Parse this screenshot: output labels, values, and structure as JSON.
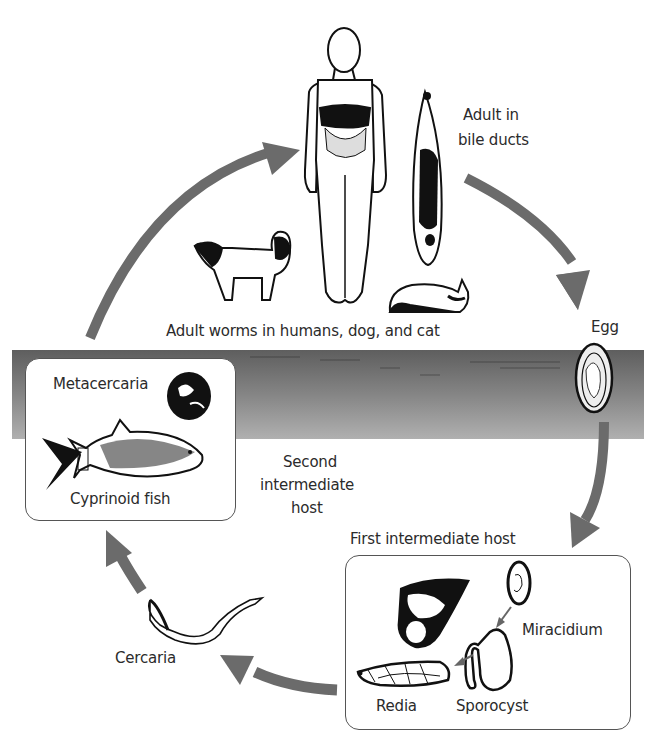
{
  "diagram": {
    "type": "life-cycle",
    "colors": {
      "arrow": "#6b6b6b",
      "water_top": "#5e5e5e",
      "water_bottom": "#ababab",
      "box_border": "#555555",
      "ink": "#111111",
      "text": "#2b2b2b"
    },
    "labels": {
      "adult_in_bile_ducts_line1": "Adult in",
      "adult_in_bile_ducts_line2": "bile ducts",
      "definitive_hosts": "Adult worms in humans, dog, and cat",
      "egg": "Egg",
      "metacercaria": "Metacercaria",
      "cyprinoid_fish": "Cyprinoid fish",
      "second_host_line1": "Second",
      "second_host_line2": "intermediate",
      "second_host_line3": "host",
      "first_intermediate_host": "First intermediate host",
      "miracidium": "Miracidium",
      "sporocyst": "Sporocyst",
      "redia": "Redia",
      "cercaria": "Cercaria"
    },
    "stages": [
      {
        "id": "adult",
        "label": "Adult in bile ducts"
      },
      {
        "id": "egg",
        "label": "Egg"
      },
      {
        "id": "first_intermediate_host",
        "label": "First intermediate host",
        "contents": [
          "Miracidium",
          "Sporocyst",
          "Redia"
        ]
      },
      {
        "id": "cercaria",
        "label": "Cercaria"
      },
      {
        "id": "second_intermediate_host",
        "label": "Second intermediate host",
        "contents": [
          "Metacercaria",
          "Cyprinoid fish"
        ]
      },
      {
        "id": "definitive_hosts",
        "label": "Adult worms in humans, dog, and cat"
      }
    ],
    "flow": [
      {
        "from": "adult",
        "to": "egg"
      },
      {
        "from": "egg",
        "to": "first_intermediate_host"
      },
      {
        "from": "first_intermediate_host",
        "to": "cercaria"
      },
      {
        "from": "cercaria",
        "to": "second_intermediate_host"
      },
      {
        "from": "second_intermediate_host",
        "to": "definitive_hosts"
      },
      {
        "from": "miracidium",
        "to": "sporocyst"
      },
      {
        "from": "sporocyst",
        "to": "redia"
      }
    ]
  }
}
